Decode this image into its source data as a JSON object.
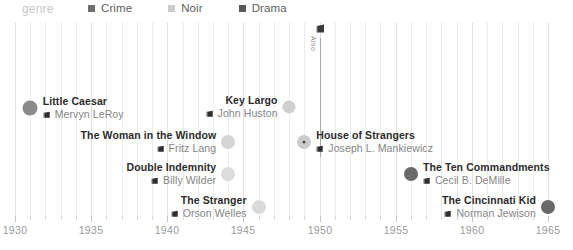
{
  "legend": {
    "title": "genre",
    "items": [
      {
        "label": "Crime",
        "color": "#6e6e6e"
      },
      {
        "label": "Noir",
        "color": "#cccccc"
      },
      {
        "label": "Drama",
        "color": "#595959"
      }
    ]
  },
  "axis": {
    "min": 1930,
    "max": 1965,
    "tick_step": 1,
    "label_step": 5,
    "labels": [
      "1930",
      "1935",
      "1940",
      "1945",
      "1950",
      "1955",
      "1960",
      "1965"
    ],
    "tick_color": "#c4c4c4",
    "label_color": "#9a9a9a"
  },
  "annotation": {
    "text": "Also",
    "year": 1950,
    "icon_name": "film-icon",
    "line_color": "#a8a8a8"
  },
  "chart_data": {
    "type": "scatter",
    "title": "",
    "xlabel": "",
    "ylabel": "",
    "xlim": [
      1930,
      1965
    ],
    "grid": true,
    "legend_position": "top",
    "series": [
      {
        "name": "Crime",
        "color": "#6e6e6e"
      },
      {
        "name": "Noir",
        "color": "#cccccc"
      },
      {
        "name": "Drama",
        "color": "#595959"
      }
    ],
    "points": [
      {
        "title": "Little Caesar",
        "director": "Mervyn LeRoy",
        "year": 1931,
        "genre": "Crime",
        "color": "#8a8a8a",
        "size": 15,
        "row": 0,
        "label_side": "right",
        "highlighted": false
      },
      {
        "title": "Key Largo",
        "director": "John Huston",
        "year": 1948,
        "genre": "Noir",
        "color": "#cfcfcf",
        "size": 13,
        "row": 0,
        "label_side": "left",
        "highlighted": false
      },
      {
        "title": "The Woman in the Window",
        "director": "Fritz Lang",
        "year": 1944,
        "genre": "Noir",
        "color": "#d4d4d4",
        "size": 14,
        "row": 1,
        "label_side": "left",
        "highlighted": false
      },
      {
        "title": "House of Strangers",
        "director": "Joseph L. Mankiewicz",
        "year": 1949,
        "genre": "Noir",
        "color": "#cccccc",
        "size": 14,
        "row": 1,
        "label_side": "right",
        "highlighted": true
      },
      {
        "title": "Double Indemnity",
        "director": "Billy Wilder",
        "year": 1944,
        "genre": "Noir",
        "color": "#dcdcdc",
        "size": 14,
        "row": 2,
        "label_side": "left",
        "highlighted": false
      },
      {
        "title": "The Ten Commandments",
        "director": "Cecil B. DeMille",
        "year": 1956,
        "genre": "Drama",
        "color": "#6a6a6a",
        "size": 14,
        "row": 2,
        "label_side": "right",
        "highlighted": false
      },
      {
        "title": "The Stranger",
        "director": "Orson Welles",
        "year": 1946,
        "genre": "Noir",
        "color": "#dadada",
        "size": 14,
        "row": 3,
        "label_side": "left",
        "highlighted": false
      },
      {
        "title": "The Cincinnati Kid",
        "director": "Norman Jewison",
        "year": 1965,
        "genre": "Drama",
        "color": "#6a6a6a",
        "size": 14,
        "row": 3,
        "label_side": "left",
        "highlighted": false
      }
    ]
  }
}
